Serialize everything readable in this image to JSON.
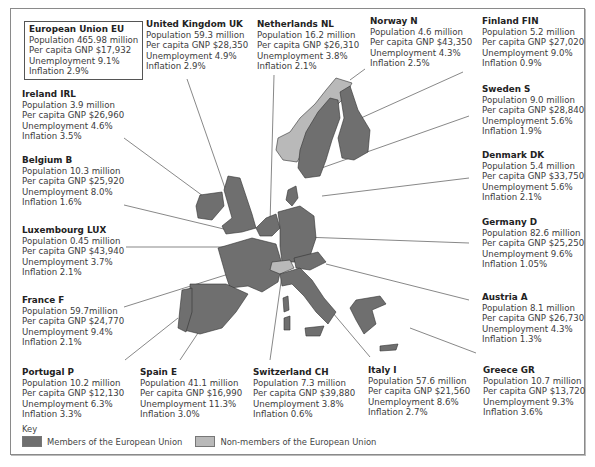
{
  "colors": {
    "member": "#6f6f6f",
    "non_member": "#b9b9b9",
    "leader": "#555555",
    "border": "#8a8a8a"
  },
  "eu": {
    "title": "European Union EU",
    "population": "Population 465.98 million",
    "gnp": "Per capita GNP $17,932",
    "unemployment": "Unemployment 9.1%",
    "inflation": "Inflation 2.9%"
  },
  "countries": [
    {
      "title": "United Kingdom UK",
      "population": "Population 59.3 million",
      "gnp": "Per capita GNP $28,350",
      "unemployment": "Unemployment 4.9%",
      "inflation": "Inflation 2.9%"
    },
    {
      "title": "Netherlands NL",
      "population": "Population 16.2 million",
      "gnp": "Per capita GNP $26,310",
      "unemployment": "Unemployment 3.8%",
      "inflation": "Inflation 2.1%"
    },
    {
      "title": "Norway N",
      "population": "Population 4.6 million",
      "gnp": "Per capita GNP $43,350",
      "unemployment": "Unemployment 4.3%",
      "inflation": "Inflation 2.5%"
    },
    {
      "title": "Finland FIN",
      "population": "Population 5.2 million",
      "gnp": "Per capita GNP $27,020",
      "unemployment": "Unemployment 9.0%",
      "inflation": "Inflation 0.9%"
    },
    {
      "title": "Ireland IRL",
      "population": "Population 3.9 million",
      "gnp": "Per capita GNP $26,960",
      "unemployment": "Unemployment 4.6%",
      "inflation": "Inflation 3.5%"
    },
    {
      "title": "Sweden S",
      "population": "Population 9.0 million",
      "gnp": "Per capita GNP $28,840",
      "unemployment": "Unemployment 5.6%",
      "inflation": "Inflation 1.9%"
    },
    {
      "title": "Belgium B",
      "population": "Population 10.3 million",
      "gnp": "Per capita GNP $25,920",
      "unemployment": "Unemployment 8.0%",
      "inflation": "Inflation 1.6%"
    },
    {
      "title": "Denmark DK",
      "population": "Population 5.4 million",
      "gnp": "Per capita GNP $33,750",
      "unemployment": "Unemployment 5.6%",
      "inflation": "Inflation 2.1%"
    },
    {
      "title": "Luxembourg LUX",
      "population": "Population 0.45 million",
      "gnp": "Per capita GNP $43,940",
      "unemployment": "Unemployment 3.7%",
      "inflation": "Inflation 2.1%"
    },
    {
      "title": "Germany D",
      "population": "Population 82.6 million",
      "gnp": "Per capita GNP $25,250",
      "unemployment": "Unemployment 9.6%",
      "inflation": "Inflation 1.05%"
    },
    {
      "title": "France F",
      "population": "Population 59.7million",
      "gnp": "Per capita GNP $24,770",
      "unemployment": "Unemployment 9.4%",
      "inflation": "Inflation 2.1%"
    },
    {
      "title": "Austria A",
      "population": "Population 8.1 million",
      "gnp": "Per capita GNP $26,730",
      "unemployment": "Unemployment 4.3%",
      "inflation": "Inflation 1.3%"
    },
    {
      "title": "Portugal P",
      "population": "Population 10.2 million",
      "gnp": "Per capita GNP $12,130",
      "unemployment": "Unemployment 6.3%",
      "inflation": "Inflation 3.3%"
    },
    {
      "title": "Spain E",
      "population": "Population 41.1 million",
      "gnp": "Per capita GNP $16,990",
      "unemployment": "Unemployment 11.3%",
      "inflation": "Inflation 3.0%"
    },
    {
      "title": "Switzerland CH",
      "population": "Population 7.3 million",
      "gnp": "Per capita GNP $39,880",
      "unemployment": "Unemployment 3.8%",
      "inflation": "Inflation 0.6%"
    },
    {
      "title": "Italy I",
      "population": "Population 57.6 million",
      "gnp": "Per capita GNP $21,560",
      "unemployment": "Unemployment 8.6%",
      "inflation": "Inflation 2.7%"
    },
    {
      "title": "Greece GR",
      "population": "Population 10.7 million",
      "gnp": "Per capita GNP $13,720",
      "unemployment": "Unemployment 9.3%",
      "inflation": "Inflation 3.6%"
    }
  ],
  "key": {
    "title": "Key",
    "member_label": "Members of the European Union",
    "non_member_label": "Non-members of the European Union"
  }
}
